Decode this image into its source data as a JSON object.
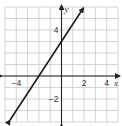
{
  "chart_data": {
    "type": "line",
    "title": "",
    "xlabel": "x",
    "ylabel": "y",
    "xlim": [
      -5,
      5
    ],
    "ylim": [
      -4,
      6
    ],
    "grid": true,
    "x_ticks": [
      {
        "value": -4,
        "label": "−4"
      },
      {
        "value": 2,
        "label": "2"
      },
      {
        "value": 4,
        "label": "4"
      }
    ],
    "y_ticks": [
      {
        "value": 4,
        "label": "4"
      },
      {
        "value": -2,
        "label": "−2"
      }
    ],
    "series": [
      {
        "name": "line",
        "equation": "y = 1.5x + 3",
        "slope": 1.5,
        "intercept": 3,
        "x_intercept": -2,
        "y_intercept": 3,
        "x": [
          -4.55,
          1.95
        ],
        "y": [
          -3.83,
          5.93
        ],
        "arrows": "both"
      }
    ],
    "colors": {
      "grid": "#c9c9c9",
      "axis": "#222222",
      "line": "#1a1a1a"
    }
  }
}
